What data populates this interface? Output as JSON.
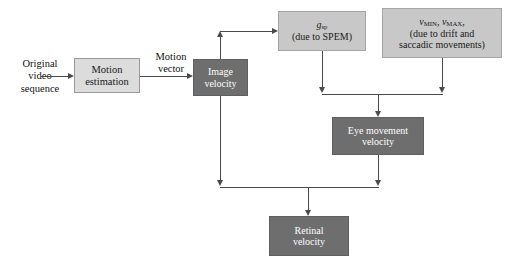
{
  "diagram": {
    "colors": {
      "box_light": "#dcdcdc",
      "box_mid": "#c8c8c8",
      "box_dark": "#6e6e6e",
      "connector": "#4a4a4a",
      "text_dark": "#1a1a1a",
      "text_light": "#ffffff",
      "background": "#ffffff"
    },
    "labels": {
      "original_video_sequence": "Original\nvideo\nsequence",
      "motion_vector": "Motion\nvector"
    },
    "nodes": {
      "motion_estimation": {
        "label": "Motion\nestimation",
        "style": "light"
      },
      "image_velocity": {
        "label": "Image\nvelocity",
        "style": "dark"
      },
      "gsp": {
        "symbol": "g",
        "subscript": "sp",
        "caption": "(due to SPEM)",
        "style": "mid"
      },
      "vminmax": {
        "symbol_1": "v",
        "subscript_1": "MIN",
        "symbol_2": "v",
        "subscript_2": "MAX",
        "caption_line_1": "(due to drift and",
        "caption_line_2": "saccadic movements)",
        "style": "mid"
      },
      "eye_movement_velocity": {
        "label": "Eye movement\nvelocity",
        "style": "dark"
      },
      "retinal_velocity": {
        "label": "Retinal\nvelocity",
        "style": "dark"
      }
    },
    "edges": [
      {
        "from": "original_video_sequence",
        "to": "motion_estimation"
      },
      {
        "from": "motion_estimation",
        "to": "image_velocity",
        "label": "Motion vector"
      },
      {
        "from": "image_velocity",
        "to": "gsp"
      },
      {
        "from": "gsp",
        "to": "eye_movement_velocity"
      },
      {
        "from": "vminmax",
        "to": "eye_movement_velocity"
      },
      {
        "from": "image_velocity",
        "to": "retinal_velocity"
      },
      {
        "from": "eye_movement_velocity",
        "to": "retinal_velocity"
      }
    ]
  }
}
